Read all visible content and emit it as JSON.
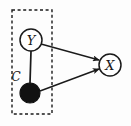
{
  "figure": {
    "type": "causal-graph-diagram",
    "background_color": "#fdfdfd",
    "stroke_color": "#1a1a1a",
    "width": 131,
    "height": 126
  },
  "plate": {
    "label": "C",
    "style": "dashed",
    "x": 12,
    "y": 10,
    "width": 40,
    "height": 104,
    "label_x": 16,
    "label_y": 77
  },
  "nodes": [
    {
      "id": "Y",
      "label": "Y",
      "shape": "circle",
      "fill": "none",
      "observed": true,
      "cx": 31,
      "cy": 40,
      "r": 11
    },
    {
      "id": "U",
      "label": "",
      "shape": "circle",
      "fill": "#111111",
      "observed": false,
      "cx": 30,
      "cy": 93,
      "r": 10
    },
    {
      "id": "X",
      "label": "X",
      "shape": "circle",
      "fill": "none",
      "observed": true,
      "cx": 110,
      "cy": 65,
      "r": 11
    }
  ],
  "edges": [
    {
      "from": "Y",
      "to": "U",
      "directed": false,
      "x1": 31,
      "y1": 51,
      "x2": 30,
      "y2": 83
    },
    {
      "from": "Y",
      "to": "X",
      "directed": true,
      "x1": 41,
      "y1": 44,
      "x2": 99,
      "y2": 60
    },
    {
      "from": "U",
      "to": "X",
      "directed": true,
      "x1": 40,
      "y1": 91,
      "x2": 99,
      "y2": 69
    }
  ]
}
